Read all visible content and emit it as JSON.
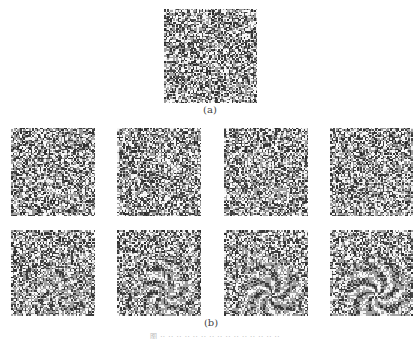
{
  "figure": {
    "panel_a": {
      "label": "(a)",
      "x": 164,
      "y": 9,
      "w": 93,
      "h": 94,
      "seed": 7,
      "swirl": 0
    },
    "panel_b": {
      "label": "(b)",
      "tiles": [
        {
          "x": 11,
          "y": 128,
          "w": 84,
          "h": 88,
          "seed": 11,
          "swirl": 0.05
        },
        {
          "x": 117,
          "y": 128,
          "w": 84,
          "h": 88,
          "seed": 13,
          "swirl": 0.1
        },
        {
          "x": 224,
          "y": 128,
          "w": 84,
          "h": 88,
          "seed": 17,
          "swirl": 0.15
        },
        {
          "x": 330,
          "y": 128,
          "w": 83,
          "h": 88,
          "seed": 19,
          "swirl": 0.2
        },
        {
          "x": 11,
          "y": 230,
          "w": 84,
          "h": 86,
          "seed": 23,
          "swirl": 0.4
        },
        {
          "x": 117,
          "y": 230,
          "w": 84,
          "h": 86,
          "seed": 29,
          "swirl": 0.5
        },
        {
          "x": 224,
          "y": 230,
          "w": 84,
          "h": 86,
          "seed": 31,
          "swirl": 0.6
        },
        {
          "x": 330,
          "y": 230,
          "w": 83,
          "h": 86,
          "seed": 37,
          "swirl": 0.7
        }
      ]
    },
    "caption": "图 ·· ·· ·· ·· ·· ·· ·· ·· ·· ·· ·· ·· ·· ·· ··"
  }
}
